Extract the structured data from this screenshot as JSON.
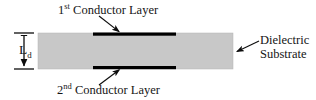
{
  "figure": {
    "type": "cross-section-diagram",
    "background_color": "#ffffff"
  },
  "substrate": {
    "name": "Dielectric Substrate",
    "fill_color": "#c8c8c8",
    "x": 38,
    "y": 33,
    "width": 195,
    "height": 36
  },
  "conductors": {
    "color": "#000000",
    "top": {
      "label_text": "Conductor Layer",
      "ordinal": "1",
      "ordinal_suffix": "st",
      "x": 93,
      "y": 33,
      "width": 83,
      "height": 3
    },
    "bottom": {
      "label_text": "Conductor Layer",
      "ordinal": "2",
      "ordinal_suffix": "nd",
      "x": 93,
      "y": 66,
      "width": 83,
      "height": 3
    }
  },
  "labels": {
    "top": {
      "ordinal": "1",
      "ordinal_suffix": "st",
      "text": "Conductor Layer"
    },
    "bottom": {
      "ordinal": "2",
      "ordinal_suffix": "nd",
      "text": "Conductor Layer"
    },
    "right": {
      "line1": "Dielectric",
      "line2": "Substrate"
    },
    "dimension": {
      "symbol": "L",
      "subscript": "d",
      "meaning": "dielectric thickness"
    }
  },
  "leaders": {
    "stroke_color": "#0d0d0d",
    "top_arrow": {
      "x1": 99,
      "y1": 16,
      "x2": 121,
      "y2": 33
    },
    "bottom_arrow": {
      "x1": 99,
      "y1": 85,
      "x2": 121,
      "y2": 68
    },
    "right_arrow": {
      "x1": 259,
      "y1": 41,
      "x2": 235,
      "y2": 52
    }
  },
  "dimension_line": {
    "stroke_color": "#0d0d0d",
    "x": 24,
    "top_y": 33,
    "bottom_y": 69,
    "cap_x1": 14,
    "cap_x2": 34
  }
}
